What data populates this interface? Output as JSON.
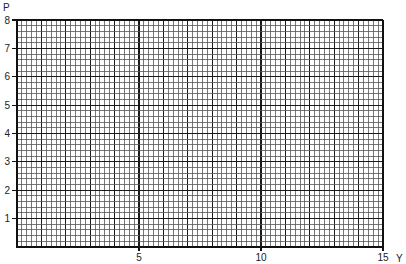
{
  "chart_data": {
    "type": "line",
    "title": "",
    "xlabel": "Y",
    "ylabel": "P",
    "xlim": [
      0,
      15
    ],
    "ylim": [
      0,
      8
    ],
    "x_ticks": [
      5,
      10,
      15
    ],
    "x_tick_labels": [
      "5",
      "10",
      "15"
    ],
    "y_ticks": [
      1,
      2,
      3,
      4,
      5,
      6,
      7,
      8
    ],
    "y_tick_labels": [
      "1",
      "2",
      "3",
      "4",
      "5",
      "6",
      "7",
      "8"
    ],
    "minor_subdivisions_per_unit": 5,
    "grid": true,
    "series": [],
    "colors": {
      "major": "#1a1a1a",
      "minor": "#555555",
      "axis": "#111111"
    }
  }
}
